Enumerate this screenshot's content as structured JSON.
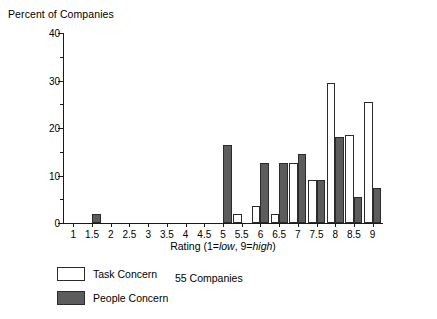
{
  "chart_data": {
    "type": "bar",
    "title": "Percent of Companies",
    "xlabel_prefix": "Rating (1=",
    "xlabel": "Rating (1=low, 9=high)",
    "ylabel": "Percent of Companies",
    "note": "55 Companies",
    "categories": [
      "1",
      "1.5",
      "2",
      "2.5",
      "3",
      "3.5",
      "4",
      "4.5",
      "5",
      "5.5",
      "6",
      "6.5",
      "7",
      "7.5",
      "8",
      "8.5",
      "9"
    ],
    "ylim": [
      0,
      40
    ],
    "yticks": [
      0,
      10,
      20,
      30,
      40
    ],
    "yticks_minor": [
      5,
      15,
      25,
      35
    ],
    "grid": false,
    "legend_position": "below-left",
    "series": [
      {
        "name": "Task Concern",
        "color": "#ffffff",
        "values": [
          0,
          0,
          0,
          0,
          0,
          0,
          0,
          0,
          0,
          1.8,
          3.6,
          1.8,
          12.7,
          9.1,
          29.5,
          18.5,
          25.5
        ]
      },
      {
        "name": "People Concern",
        "color": "#5c5c5c",
        "values": [
          0,
          1.8,
          0,
          0,
          0,
          0,
          0,
          0,
          16.5,
          0,
          12.7,
          12.7,
          14.5,
          9.1,
          18.2,
          5.5,
          7.3
        ]
      }
    ]
  },
  "legend": {
    "items": [
      {
        "label": "Task Concern",
        "style": "task"
      },
      {
        "label": "People Concern",
        "style": "people"
      }
    ]
  },
  "xaxis_title_parts": {
    "a": "Rating (1=",
    "low": "low",
    "b": ", 9=",
    "high": "high",
    "c": ")"
  }
}
